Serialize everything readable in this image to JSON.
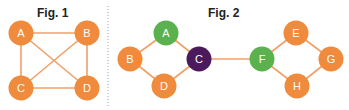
{
  "colors": {
    "orange": "#F08A3C",
    "green": "#5BB14D",
    "purple": "#4A1A5C",
    "edge": "#F0A066",
    "divider": "#8FA3B8"
  },
  "fig1": {
    "title": "Fig. 1",
    "nodes": [
      {
        "id": "A",
        "label": "A",
        "x": 21,
        "y": 33,
        "color": "orange"
      },
      {
        "id": "B",
        "label": "B",
        "x": 87,
        "y": 33,
        "color": "orange"
      },
      {
        "id": "C",
        "label": "C",
        "x": 21,
        "y": 88,
        "color": "orange"
      },
      {
        "id": "D",
        "label": "D",
        "x": 87,
        "y": 88,
        "color": "orange"
      }
    ],
    "edges": [
      [
        "A",
        "B"
      ],
      [
        "A",
        "C"
      ],
      [
        "A",
        "D"
      ],
      [
        "B",
        "C"
      ],
      [
        "B",
        "D"
      ],
      [
        "C",
        "D"
      ]
    ]
  },
  "fig2": {
    "title": "Fig. 2",
    "nodes": [
      {
        "id": "A",
        "label": "A",
        "x": 166,
        "y": 33,
        "color": "green"
      },
      {
        "id": "B",
        "label": "B",
        "x": 130,
        "y": 59,
        "color": "orange"
      },
      {
        "id": "C",
        "label": "C",
        "x": 199,
        "y": 59,
        "color": "purple"
      },
      {
        "id": "D",
        "label": "D",
        "x": 164,
        "y": 86,
        "color": "orange"
      },
      {
        "id": "F",
        "label": "F",
        "x": 262,
        "y": 59,
        "color": "green"
      },
      {
        "id": "E",
        "label": "E",
        "x": 296,
        "y": 33,
        "color": "orange"
      },
      {
        "id": "G",
        "label": "G",
        "x": 331,
        "y": 59,
        "color": "orange"
      },
      {
        "id": "H",
        "label": "H",
        "x": 297,
        "y": 86,
        "color": "orange"
      }
    ],
    "edges": [
      [
        "A",
        "B"
      ],
      [
        "A",
        "C"
      ],
      [
        "B",
        "D"
      ],
      [
        "D",
        "C"
      ],
      [
        "C",
        "F"
      ],
      [
        "F",
        "E"
      ],
      [
        "E",
        "G"
      ],
      [
        "F",
        "H"
      ],
      [
        "H",
        "G"
      ]
    ]
  }
}
